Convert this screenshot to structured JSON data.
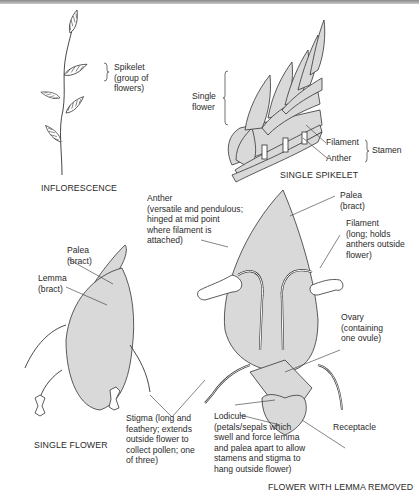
{
  "figure": {
    "colors": {
      "fill": "#d9d9d9",
      "stroke": "#3a3a3a",
      "text": "#2a2a2a",
      "top_rule": "#8a8a8a"
    },
    "panels": {
      "inflorescence": {
        "caption": "INFLORESCENCE",
        "labels": {
          "spikelet": [
            "Spikelet",
            "(group of",
            "flowers)"
          ]
        }
      },
      "single_spikelet": {
        "caption": "SINGLE SPIKELET",
        "labels": {
          "single_flower": [
            "Single",
            "flower"
          ],
          "filament": "Filament",
          "anther": "Anther",
          "stamen": "Stamen"
        }
      },
      "single_flower": {
        "caption": "SINGLE FLOWER",
        "labels": {
          "palea": [
            "Palea",
            "(bract)"
          ],
          "lemma": [
            "Lemma",
            "(bract)"
          ]
        }
      },
      "flower_with_lemma_removed": {
        "caption": "FLOWER WITH LEMMA REMOVED",
        "labels": {
          "anther": [
            "Anther",
            "(versatile and pendulous;",
            "hinged at mid point",
            "where filament is",
            "attached)"
          ],
          "palea": [
            "Palea",
            "(bract)"
          ],
          "filament": [
            "Filament",
            "(long; holds",
            "anthers outside",
            "flower)"
          ],
          "ovary": [
            "Ovary",
            "(containing",
            "one ovule)"
          ],
          "stigma": [
            "Stigma (long and",
            "feathery; extends",
            "outside flower to",
            "collect pollen; one",
            "of three)"
          ],
          "lodicule": [
            "Lodicule",
            "(petals/sepals which",
            "swell and force lemma",
            "and palea apart to allow",
            "stamens and stigma to",
            "hang outside flower)"
          ],
          "receptacle": "Receptacle"
        }
      }
    }
  }
}
